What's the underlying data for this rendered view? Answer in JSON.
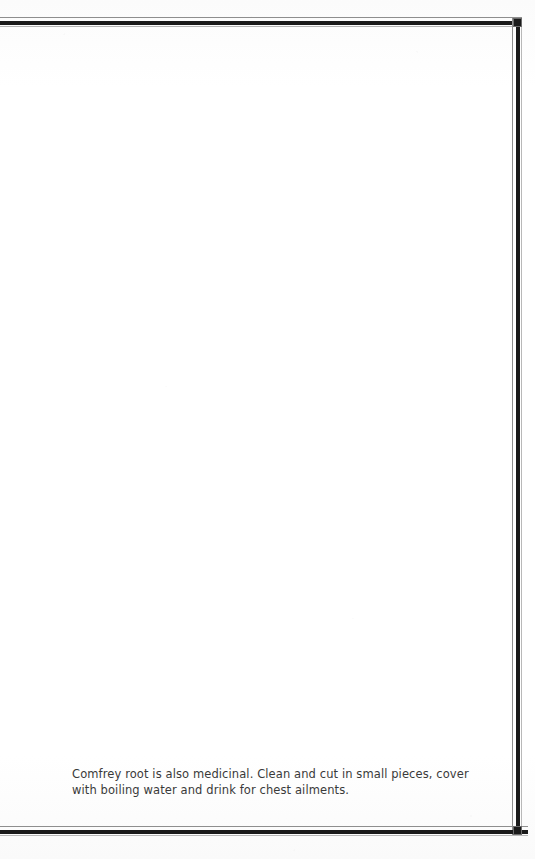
{
  "page": {
    "background_color": "#fdfdfd",
    "ink_color": "#1a1a1a",
    "text_color": "#3a3a3a"
  },
  "frame": {
    "style": "double-rule",
    "top_rule": "",
    "bottom_rule": "",
    "right_rule": "",
    "corner_top_right": "",
    "corner_bottom_right": ""
  },
  "body": {
    "paragraph": "Comfrey root is also medicinal. Clean and cut in small pieces, cover with boiling water and drink for chest ailments."
  }
}
